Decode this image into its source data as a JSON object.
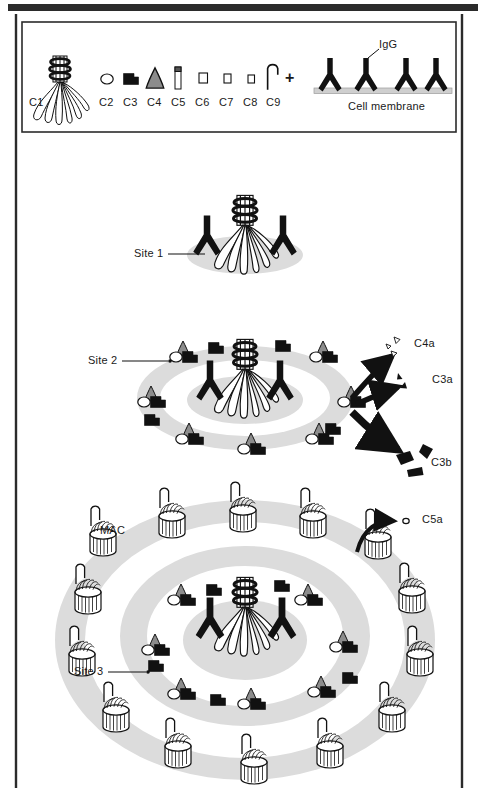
{
  "figure": {
    "border_color": "#2b2b2b",
    "ring_color": "#dcdcdc",
    "ink_color": "#111111",
    "gray_fill": "#8c8c8c",
    "membrane_color": "#cfcfcf"
  },
  "legend": {
    "components": [
      {
        "id": "C1",
        "label": "C1",
        "icon": "c1-bouquet-icon"
      },
      {
        "id": "C2",
        "label": "C2",
        "icon": "c2-oval-icon"
      },
      {
        "id": "C3",
        "label": "C3",
        "icon": "c3-notched-block-icon"
      },
      {
        "id": "C4",
        "label": "C4",
        "icon": "c4-cone-icon"
      },
      {
        "id": "C5",
        "label": "C5",
        "icon": "c5-capped-cylinder-icon"
      },
      {
        "id": "C6",
        "label": "C6",
        "icon": "c6-square-icon"
      },
      {
        "id": "C7",
        "label": "C7",
        "icon": "c7-square-icon"
      },
      {
        "id": "C8",
        "label": "C8",
        "icon": "c8-square-icon"
      },
      {
        "id": "C9",
        "label": "C9",
        "icon": "c9-hook-icon"
      }
    ],
    "plus_sign": "+",
    "antibody_label": "IgG",
    "membrane_label": "Cell membrane"
  },
  "panels": {
    "site1": {
      "label": "Site 1"
    },
    "site2": {
      "label": "Site 2"
    },
    "site3": {
      "label": "Site 3",
      "mac_label": "MAC"
    }
  },
  "products": {
    "c4a": "C4a",
    "c3a": "C3a",
    "c3b": "C3b",
    "c5a": "C5a"
  }
}
